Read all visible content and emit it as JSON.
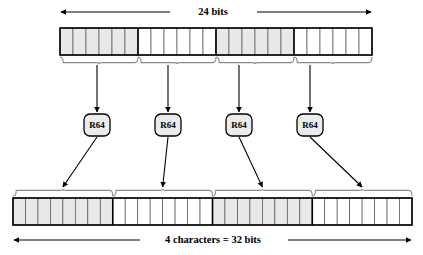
{
  "diagram": {
    "top_dimension_label": "24 bits",
    "bottom_dimension_label": "4 characters = 32 bits",
    "encoder_label": "R64",
    "encoders": [
      {
        "label": "R64"
      },
      {
        "label": "R64"
      },
      {
        "label": "R64"
      },
      {
        "label": "R64"
      }
    ],
    "top_bar": {
      "total_cells": 24,
      "group_count": 4,
      "cells_per_group": 6,
      "groups": [
        {
          "index": 1,
          "cells": 6,
          "shaded": true
        },
        {
          "index": 2,
          "cells": 6,
          "shaded": false
        },
        {
          "index": 3,
          "cells": 6,
          "shaded": true
        },
        {
          "index": 4,
          "cells": 6,
          "shaded": false
        }
      ]
    },
    "bottom_bar": {
      "total_cells": 32,
      "group_count": 4,
      "cells_per_group": 8,
      "groups": [
        {
          "index": 1,
          "cells": 8,
          "shaded": true
        },
        {
          "index": 2,
          "cells": 8,
          "shaded": false
        },
        {
          "index": 3,
          "cells": 8,
          "shaded": true
        },
        {
          "index": 4,
          "cells": 8,
          "shaded": false
        }
      ]
    },
    "colors": {
      "shaded_cell": "#e8e8e8",
      "plain_cell": "#ffffff",
      "cell_stroke": "#555555",
      "frame_stroke": "#000000",
      "brace_stroke": "#8a8a8a",
      "node_fill": "#ececec",
      "background": "#ffffff"
    },
    "geometry": {
      "top_bar": {
        "x": 60,
        "y": 28,
        "width": 312,
        "height": 27
      },
      "bottom_bar": {
        "x": 13,
        "y": 198,
        "width": 399,
        "height": 27
      },
      "node_row_y": 114,
      "node_width": 26,
      "node_height": 22,
      "node_centers_x": [
        97,
        168,
        239,
        310
      ],
      "top_dim_y": 12,
      "bottom_dim_y": 240
    }
  }
}
